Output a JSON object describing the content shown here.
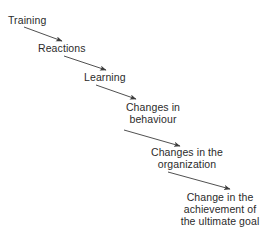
{
  "diagram": {
    "type": "flow-chart",
    "text_color": "#2b2b2b",
    "arrow_color": "#3c3c3c",
    "background_color": "#ffffff",
    "nodes": [
      {
        "id": "training",
        "lines": [
          "Training"
        ],
        "align": "left"
      },
      {
        "id": "reactions",
        "lines": [
          "Reactions"
        ],
        "align": "left"
      },
      {
        "id": "learning",
        "lines": [
          "Learning"
        ],
        "align": "left"
      },
      {
        "id": "behaviour",
        "lines": [
          "Changes in",
          "behaviour"
        ],
        "align": "center"
      },
      {
        "id": "organization",
        "lines": [
          "Changes in the",
          "organization"
        ],
        "align": "center"
      },
      {
        "id": "goal",
        "lines": [
          "Change in the",
          "achievement of",
          "the ultimate goal"
        ],
        "align": "center"
      }
    ],
    "connections": [
      {
        "from": "training",
        "to": "reactions"
      },
      {
        "from": "reactions",
        "to": "learning"
      },
      {
        "from": "learning",
        "to": "behaviour"
      },
      {
        "from": "behaviour",
        "to": "organization"
      },
      {
        "from": "organization",
        "to": "goal"
      }
    ]
  }
}
